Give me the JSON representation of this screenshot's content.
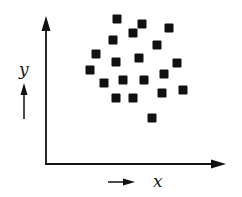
{
  "diagram": {
    "type": "scatter",
    "x_label": "x",
    "y_label": "y",
    "colors": {
      "ink": "#111111",
      "background": "#ffffff"
    },
    "marker": {
      "shape": "square",
      "size_px": 9
    }
  },
  "chart_data": {
    "type": "scatter",
    "title": "",
    "xlabel": "x",
    "ylabel": "y",
    "grid": false,
    "legend": false,
    "ticks": false,
    "note": "Points given in pixel coordinates of the original 242x197 figure (origin of axes at approx (46,164)); no numeric scale shown.",
    "points": [
      {
        "x": 117,
        "y": 19
      },
      {
        "x": 142,
        "y": 24
      },
      {
        "x": 133,
        "y": 33
      },
      {
        "x": 169,
        "y": 28
      },
      {
        "x": 113,
        "y": 40
      },
      {
        "x": 157,
        "y": 45
      },
      {
        "x": 96,
        "y": 54
      },
      {
        "x": 116,
        "y": 62
      },
      {
        "x": 139,
        "y": 58
      },
      {
        "x": 177,
        "y": 63
      },
      {
        "x": 90,
        "y": 70
      },
      {
        "x": 164,
        "y": 74
      },
      {
        "x": 104,
        "y": 83
      },
      {
        "x": 123,
        "y": 80
      },
      {
        "x": 144,
        "y": 80
      },
      {
        "x": 183,
        "y": 90
      },
      {
        "x": 116,
        "y": 98
      },
      {
        "x": 133,
        "y": 98
      },
      {
        "x": 162,
        "y": 93
      },
      {
        "x": 152,
        "y": 118
      }
    ]
  }
}
